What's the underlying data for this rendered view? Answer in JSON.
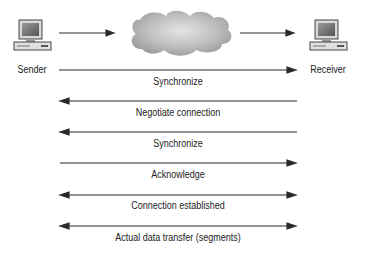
{
  "nodes": {
    "sender": {
      "label": "Sender",
      "icon": "computer-icon"
    },
    "network": {
      "icon": "cloud-icon"
    },
    "receiver": {
      "label": "Receiver",
      "icon": "computer-icon"
    }
  },
  "messages": [
    {
      "label": "Synchronize",
      "direction": "right"
    },
    {
      "label": "Negotiate connection",
      "direction": "left"
    },
    {
      "label": "Synchronize",
      "direction": "left"
    },
    {
      "label": "Acknowledge",
      "direction": "right"
    },
    {
      "label": "Connection established",
      "direction": "both"
    },
    {
      "label": "Actual data transfer (segments)",
      "direction": "both"
    }
  ],
  "colors": {
    "line": "#2a2a2a",
    "cloud": "#a8a8a8",
    "text": "#222222"
  }
}
